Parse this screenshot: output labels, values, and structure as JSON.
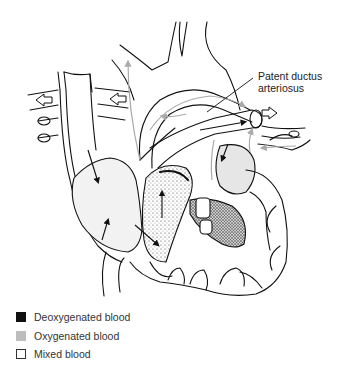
{
  "diagram": {
    "callout": {
      "line1": "Patent ductus",
      "line2": "arteriosus"
    }
  },
  "legend": {
    "items": [
      {
        "label": "Deoxygenated blood",
        "color": "#111111"
      },
      {
        "label": "Oxygenated blood",
        "color": "#bdbdbd"
      },
      {
        "label": "Mixed blood",
        "color": "#ffffff"
      }
    ]
  }
}
